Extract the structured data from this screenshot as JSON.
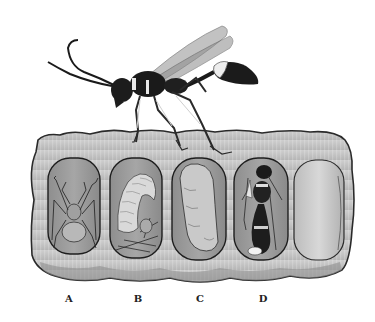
{
  "figure": {
    "adult_wasp": {
      "position": "standing-on-top-of-nest"
    },
    "nest": {
      "fill_color": "#c4c4c4",
      "cell_color": "#9a9a9a",
      "cells": [
        {
          "id": "A",
          "content": "paralyzed spider (egg)"
        },
        {
          "id": "B",
          "content": "larva feeding on spider"
        },
        {
          "id": "C",
          "content": "pupa / cocoon"
        },
        {
          "id": "D",
          "content": "developing adult wasp"
        },
        {
          "id": "",
          "content": "sealed empty cell"
        }
      ]
    },
    "labels": [
      "A",
      "B",
      "C",
      "D"
    ]
  }
}
